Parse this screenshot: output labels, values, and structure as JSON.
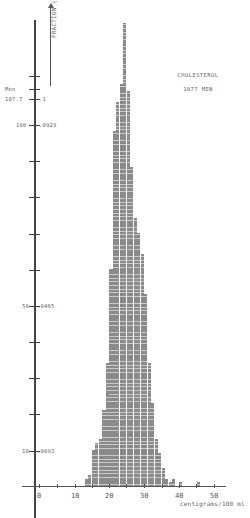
{
  "chart_data": {
    "type": "bar",
    "title": "CHOLESTEROL",
    "subtitle": "1077 MEN",
    "xlabel": "centigrams/100 ml",
    "ylabel": "Men",
    "y2label": "FRACTION (per cg.)",
    "x_ticks": [
      0,
      10,
      20,
      30,
      40,
      50
    ],
    "y_ticks": [
      {
        "men": "107.7",
        "fraction": ".1"
      },
      {
        "men": "100",
        "fraction": ".0929"
      },
      {
        "men": "50",
        "fraction": ".0465"
      },
      {
        "men": "10",
        "fraction": ".0093"
      }
    ],
    "xlim": [
      0,
      50
    ],
    "ylim": [
      0,
      130
    ],
    "grid": false,
    "bin_width": 1,
    "x": [
      13,
      14,
      15,
      16,
      17,
      18,
      19,
      20,
      21,
      22,
      23,
      24,
      25,
      26,
      27,
      28,
      29,
      30,
      31,
      32,
      33,
      34,
      35,
      36,
      37,
      38,
      40,
      45
    ],
    "values": [
      2,
      3,
      10,
      12,
      13,
      21,
      34,
      60,
      98,
      106,
      111,
      128,
      109,
      88,
      74,
      70,
      64,
      53,
      34,
      23,
      13,
      9,
      5,
      2,
      1,
      2,
      1,
      1
    ]
  },
  "labels": {
    "men": "Men",
    "fraction_axis": "FRACTION (per cg.)",
    "t107": "107.7",
    "f107": ".1",
    "t100": "100",
    "f100": ".0929",
    "t50": "50",
    "f50": ".0465",
    "t10": "10",
    "f10": ".0093",
    "x0": "0",
    "x10": "10",
    "x20": "20",
    "x30": "30",
    "x40": "40",
    "x50": "50",
    "xunit": "centigrams/100 ml",
    "title": "CHOLESTEROL",
    "subtitle": "1077 MEN"
  }
}
